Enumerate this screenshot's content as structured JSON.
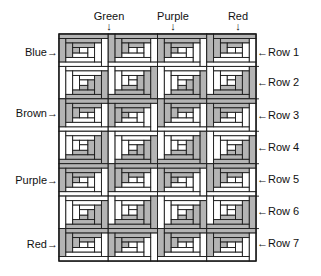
{
  "diagram": {
    "colors": {
      "shaded": "#b4b4b4",
      "light": "#ffffff",
      "line": "#1a1a1a"
    },
    "grid": {
      "columns": 4,
      "rows": 7,
      "x": 59,
      "y": 34,
      "width": 197,
      "height": 227
    },
    "top_labels": [
      {
        "text": "Green",
        "arrow": "↓"
      },
      {
        "text": "Purple",
        "arrow": "↓"
      },
      {
        "text": "Red",
        "arrow": "↓"
      }
    ],
    "left_labels": [
      {
        "text": "Blue",
        "arrow": "→"
      },
      {
        "text": "Brown",
        "arrow": "→"
      },
      {
        "text": "Purple",
        "arrow": "→"
      },
      {
        "text": "Red",
        "arrow": "→"
      }
    ],
    "right_labels": [
      {
        "text": "Row 1",
        "arrow": "←"
      },
      {
        "text": "Row 2",
        "arrow": "←"
      },
      {
        "text": "Row 3",
        "arrow": "←"
      },
      {
        "text": "Row 4",
        "arrow": "←"
      },
      {
        "text": "Row 5",
        "arrow": "←"
      },
      {
        "text": "Row 6",
        "arrow": "←"
      },
      {
        "text": "Row 7",
        "arrow": "←"
      }
    ]
  }
}
